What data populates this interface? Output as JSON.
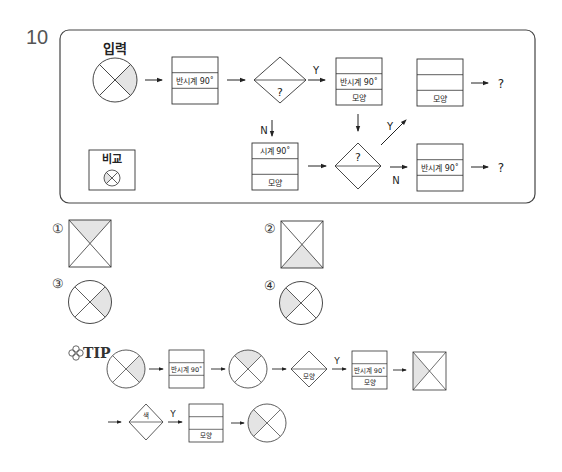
{
  "question": {
    "number": "10",
    "input_label": "입력",
    "compare_label": "비교",
    "flow": {
      "box1": {
        "rows": [
          "",
          "반시계 90˚",
          ""
        ]
      },
      "decision1": {
        "label": "?",
        "yes": "Y",
        "no": "N"
      },
      "box2": {
        "rows": [
          "",
          "반시계 90˚",
          "모양"
        ]
      },
      "box3": {
        "rows": [
          "",
          "",
          "모양"
        ]
      },
      "box4": {
        "rows": [
          "시계 90˚",
          "",
          "모양"
        ]
      },
      "decision2": {
        "label": "?",
        "yes": "Y",
        "no": "N"
      },
      "box5": {
        "rows": [
          "",
          "반시계 90˚",
          ""
        ]
      },
      "output1": "?",
      "output2": "?"
    }
  },
  "options": [
    {
      "marker": "①",
      "shape": "square",
      "shaded": "top"
    },
    {
      "marker": "②",
      "shape": "square",
      "shaded": "bottom"
    },
    {
      "marker": "③",
      "shape": "circle",
      "shaded": "right"
    },
    {
      "marker": "④",
      "shape": "circle",
      "shaded": "left"
    }
  ],
  "tip": {
    "label": "TIP",
    "icon": "clover-icon",
    "row1": {
      "box1": {
        "rows": [
          "",
          "반시계 90˚",
          ""
        ]
      },
      "decision": {
        "label": "모양",
        "yes": "Y"
      },
      "box2": {
        "rows": [
          "",
          "반시계 90˚",
          "모양"
        ]
      }
    },
    "row2": {
      "decision": {
        "label": "색",
        "yes": "Y"
      },
      "box": {
        "rows": [
          "",
          "",
          "모양"
        ]
      }
    }
  },
  "colors": {
    "shade": "#e4e4e4",
    "line": "#333333",
    "frame": "#444444"
  }
}
